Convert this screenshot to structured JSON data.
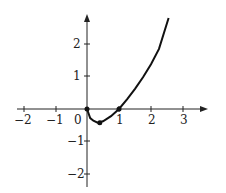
{
  "chart_data": {
    "type": "line",
    "title": "",
    "xlabel": "",
    "ylabel": "",
    "xlim": [
      -2.1,
      3.7
    ],
    "ylim": [
      -2.3,
      2.9
    ],
    "grid": false,
    "legend": null,
    "x_ticks": [
      -2,
      -1,
      1,
      2,
      3
    ],
    "x_tick_labels": [
      "−2",
      "−1",
      "1",
      "2",
      "3"
    ],
    "y_ticks": [
      -2,
      -1,
      1,
      2
    ],
    "y_tick_labels": [
      "−2",
      "−1",
      "1",
      "2"
    ],
    "origin_label": "0",
    "series": [
      {
        "name": "f(x)",
        "x": [
          0,
          0.1,
          0.2,
          0.33,
          0.5,
          0.75,
          1,
          1.25,
          1.5,
          1.75,
          2,
          2.25,
          2.55
        ],
        "y": [
          0,
          -0.28,
          -0.36,
          -0.42,
          -0.38,
          -0.22,
          0,
          0.3,
          0.62,
          0.98,
          1.38,
          1.85,
          2.8
        ]
      }
    ],
    "marked_points": [
      {
        "x": 0,
        "y": 0
      },
      {
        "x": 0.4,
        "y": -0.42
      },
      {
        "x": 1,
        "y": 0
      }
    ]
  }
}
